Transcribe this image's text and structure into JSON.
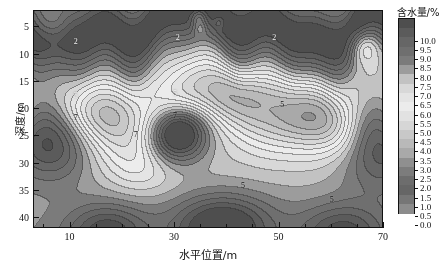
{
  "figure": {
    "xlabel": "水平位置/m",
    "ylabel": "深度/m",
    "colorbar_title": "含水量/%"
  },
  "chart_data": {
    "type": "heatmap",
    "title": "",
    "xlabel": "水平位置/m",
    "ylabel": "深度/m",
    "colorbar_label": "含水量/%",
    "xlim": [
      3,
      70
    ],
    "ylim": [
      42,
      2
    ],
    "y_inverted": true,
    "grid": false,
    "legend_position": "right",
    "x_major_ticks": [
      10,
      30,
      50,
      70
    ],
    "x_minor_ticks": [
      5,
      15,
      20,
      25,
      35,
      40,
      45,
      55,
      60,
      65
    ],
    "y_major_ticks": [
      5,
      10,
      15,
      20,
      25,
      30,
      35,
      40
    ],
    "colorbar_levels": [
      0.0,
      0.5,
      1.0,
      1.5,
      2.0,
      2.5,
      3.0,
      3.5,
      4.0,
      4.5,
      5.0,
      5.5,
      6.0,
      6.5,
      7.0,
      7.5,
      8.0,
      8.5,
      9.0,
      9.5,
      10.0
    ],
    "colorbar_tick_labels": [
      "10.0",
      "9.5",
      "9.0",
      "8.5",
      "8.0",
      "7.5",
      "7.0",
      "6.5",
      "6.0",
      "5.5",
      "5.0",
      "4.5",
      "4.0",
      "3.5",
      "3.0",
      "2.5",
      "2.0",
      "1.5",
      "1.0",
      "0.5",
      "0.0"
    ],
    "colorbar_colors": [
      "#4e4e4e",
      "#5b5b5b",
      "#666666",
      "#6f6f6f",
      "#7b7b7b",
      "#9c9c9c",
      "#c2c2c2",
      "#d8d8d8",
      "#e4e4e4",
      "#ececec",
      "#e2e2e2",
      "#d6d6d6",
      "#c8c8c8",
      "#b9b9b9",
      "#a9a9a9",
      "#8f8f8f",
      "#7c7c7c",
      "#6d6d6d",
      "#666666",
      "#767676",
      "#8c8c8c"
    ],
    "contour_labels": [
      {
        "text": "2",
        "x": 11,
        "y": 7.5,
        "light": true
      },
      {
        "text": "2",
        "x": 30.5,
        "y": 6.8,
        "light": true
      },
      {
        "text": "2",
        "x": 49.0,
        "y": 6.8,
        "light": true
      },
      {
        "text": "5",
        "x": 11.0,
        "y": 17.5,
        "light": true
      },
      {
        "text": "5",
        "x": 30.0,
        "y": 17.0,
        "light": true
      },
      {
        "text": "5",
        "x": 50.5,
        "y": 19.0,
        "light": false
      },
      {
        "text": "7",
        "x": 11.0,
        "y": 21.5,
        "light": false
      },
      {
        "text": "7",
        "x": 22.5,
        "y": 24.5,
        "light": false
      },
      {
        "text": "7",
        "x": 30.0,
        "y": 21.0,
        "light": false
      },
      {
        "text": "5",
        "x": 43.0,
        "y": 34.0,
        "light": false
      },
      {
        "text": "5",
        "x": 60.0,
        "y": 36.5,
        "light": false
      }
    ],
    "anomalies": [
      {
        "name": "surface-dry-band",
        "x_range": [
          3,
          70
        ],
        "y_range": [
          2,
          12
        ],
        "value_range": [
          8.5,
          10.0
        ],
        "note": "dark high-moisture band across top"
      },
      {
        "name": "left-dark-lobe",
        "center": [
          6,
          25
        ],
        "value": 10.0
      },
      {
        "name": "center-dark-lobe",
        "center": [
          30,
          24
        ],
        "value": 10.0
      },
      {
        "name": "right-dark-lobe",
        "center": [
          67,
          26
        ],
        "value": 9.5
      },
      {
        "name": "bright-core-left",
        "center": [
          16,
          20
        ],
        "value": 5.5
      },
      {
        "name": "bright-core-right",
        "center": [
          57,
          22
        ],
        "value": 5.5
      }
    ]
  }
}
